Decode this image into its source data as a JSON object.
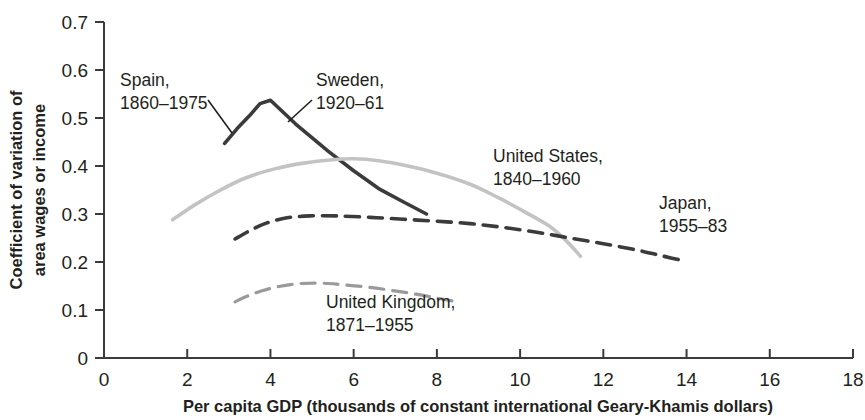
{
  "chart_data": {
    "type": "line",
    "title": "",
    "xlabel": "Per capita GDP (thousands of constant international Geary-Khamis dollars)",
    "ylabel_line1": "Coefficient of variation of",
    "ylabel_line2": "area wages or income",
    "xlim": [
      0,
      18
    ],
    "ylim": [
      0,
      0.7
    ],
    "xticks": [
      "0",
      "2",
      "4",
      "6",
      "8",
      "10",
      "12",
      "14",
      "16",
      "18"
    ],
    "xtick_values": [
      0,
      2,
      4,
      6,
      8,
      10,
      12,
      14,
      16,
      18
    ],
    "yticks": [
      "0",
      "0.1",
      "0.2",
      "0.3",
      "0.4",
      "0.5",
      "0.6",
      "0.7"
    ],
    "ytick_values": [
      0,
      0.1,
      0.2,
      0.3,
      0.4,
      0.5,
      0.6,
      0.7
    ],
    "grid": false,
    "legend": "inline-annotations",
    "series": [
      {
        "name": "Spain, 1860–1975 / Sweden, 1920–61",
        "style": "solid",
        "color": "#3c3b3b",
        "width": 3.6,
        "points": [
          [
            2.9,
            0.447
          ],
          [
            3.2,
            0.478
          ],
          [
            3.5,
            0.505
          ],
          [
            3.75,
            0.53
          ],
          [
            4.0,
            0.537
          ],
          [
            4.6,
            0.488
          ],
          [
            5.4,
            0.43
          ],
          [
            6.0,
            0.39
          ],
          [
            6.6,
            0.353
          ],
          [
            7.2,
            0.325
          ],
          [
            7.75,
            0.3
          ]
        ]
      },
      {
        "name": "United States, 1840–1960",
        "style": "solid",
        "color": "#c3c3c3",
        "width": 3.6,
        "points": [
          [
            1.65,
            0.288
          ],
          [
            2.2,
            0.32
          ],
          [
            2.8,
            0.35
          ],
          [
            3.4,
            0.375
          ],
          [
            4.1,
            0.394
          ],
          [
            4.8,
            0.406
          ],
          [
            5.5,
            0.413
          ],
          [
            6.0,
            0.415
          ],
          [
            6.6,
            0.411
          ],
          [
            7.3,
            0.4
          ],
          [
            8.0,
            0.385
          ],
          [
            8.8,
            0.362
          ],
          [
            9.5,
            0.333
          ],
          [
            10.1,
            0.305
          ],
          [
            10.7,
            0.275
          ],
          [
            11.1,
            0.245
          ],
          [
            11.45,
            0.212
          ]
        ]
      },
      {
        "name": "Japan, 1955–83",
        "style": "dashed",
        "color": "#3c3b3b",
        "width": 3.6,
        "points": [
          [
            3.15,
            0.248
          ],
          [
            3.5,
            0.265
          ],
          [
            3.9,
            0.281
          ],
          [
            4.4,
            0.292
          ],
          [
            4.95,
            0.296
          ],
          [
            5.6,
            0.296
          ],
          [
            6.4,
            0.293
          ],
          [
            7.2,
            0.289
          ],
          [
            8.0,
            0.285
          ],
          [
            8.8,
            0.28
          ],
          [
            9.6,
            0.272
          ],
          [
            10.4,
            0.262
          ],
          [
            11.2,
            0.25
          ],
          [
            12.0,
            0.238
          ],
          [
            12.8,
            0.225
          ],
          [
            13.4,
            0.213
          ],
          [
            14.0,
            0.201
          ]
        ]
      },
      {
        "name": "United Kingdom, 1871–1955",
        "style": "dashed",
        "color": "#9a9a9a",
        "width": 3.2,
        "points": [
          [
            3.15,
            0.117
          ],
          [
            3.45,
            0.129
          ],
          [
            3.8,
            0.14
          ],
          [
            4.2,
            0.149
          ],
          [
            4.7,
            0.155
          ],
          [
            5.2,
            0.156
          ],
          [
            5.7,
            0.153
          ],
          [
            6.3,
            0.148
          ],
          [
            6.9,
            0.141
          ],
          [
            7.5,
            0.133
          ],
          [
            8.05,
            0.124
          ],
          [
            8.55,
            0.116
          ]
        ]
      }
    ],
    "annotations": [
      {
        "id": "spain",
        "line1": "Spain,",
        "line2": "1860–1975",
        "x": 120,
        "y": 86,
        "leader": null
      },
      {
        "id": "sweden",
        "line1": "Sweden,",
        "line2": "1920–61",
        "x": 316,
        "y": 86,
        "leader": null
      },
      {
        "id": "united-states",
        "line1": "United States,",
        "line2": "1840–1960",
        "x": 493,
        "y": 162,
        "leader": null
      },
      {
        "id": "japan",
        "line1": "Japan,",
        "line2": "1955–83",
        "x": 659,
        "y": 209,
        "leader": null
      },
      {
        "id": "united-kingdom",
        "line1": "United Kingdom,",
        "line2": "1871–1955",
        "x": 326,
        "y": 308,
        "leader": null
      }
    ]
  }
}
